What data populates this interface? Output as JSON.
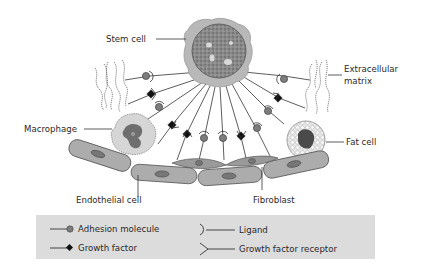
{
  "diagram": {
    "labels": {
      "stem_cell": "Stem cell",
      "extracellular_matrix_line1": "Extracellular",
      "extracellular_matrix_line2": "matrix",
      "macrophage": "Macrophage",
      "fat_cell": "Fat cell",
      "endothelial_cell": "Endothelial cell",
      "fibroblast": "Fibroblast"
    },
    "legend": {
      "items": [
        {
          "symbol": "circle-on-line",
          "label": "Adhesion molecule"
        },
        {
          "symbol": "diamond-on-line",
          "label": "Growth factor"
        },
        {
          "symbol": "cup-on-line",
          "label": "Ligand"
        },
        {
          "symbol": "fork-on-line",
          "label": "Growth factor receptor"
        }
      ]
    },
    "colors": {
      "stem_cell_body": "#b5b5b5",
      "nucleus": "#7a7a7a",
      "cell_body": "#a9a9a9",
      "cell_outline": "#4a4a4a",
      "adhesion_molecule": "#7d7d7d",
      "growth_factor": "#111111",
      "legend_bg": "#dcdcdc",
      "line": "#333333"
    }
  }
}
